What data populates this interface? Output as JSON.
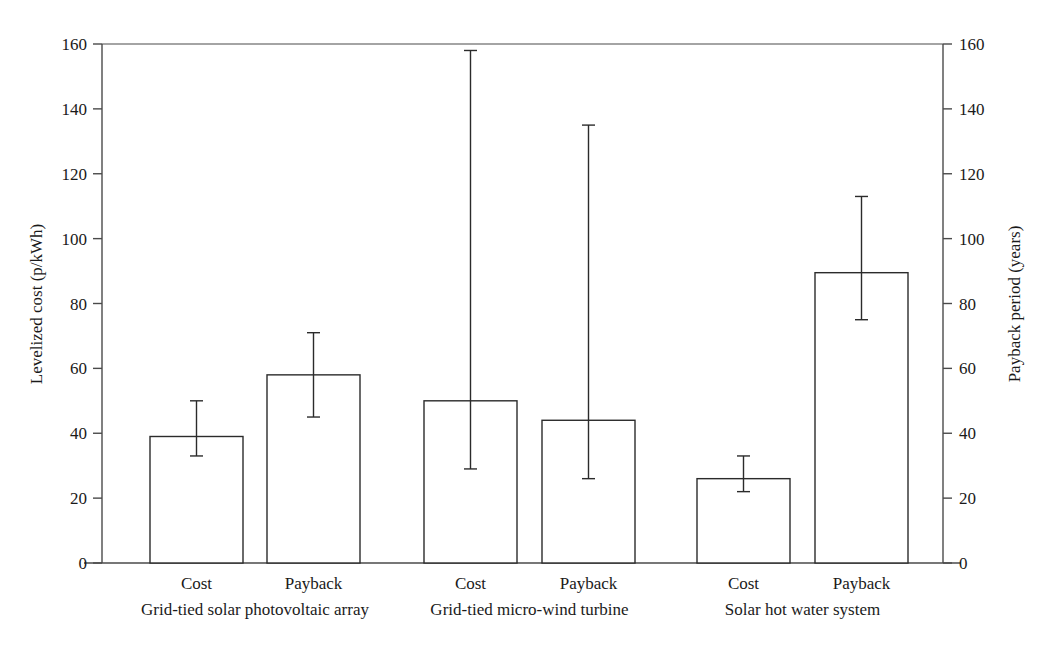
{
  "chart_data": {
    "type": "bar",
    "title": "",
    "subtitle": "",
    "grid": false,
    "legend": "none",
    "orientation": "vertical",
    "error_bars": true,
    "categories": [
      "Cost",
      "Payback",
      "Cost",
      "Payback",
      "Cost",
      "Payback"
    ],
    "groups": [
      {
        "label": "Grid-tied solar photovoltaic array",
        "bars": [
          {
            "category": "Cost",
            "axis": "left",
            "value": 39,
            "err_low": 33,
            "err_high": 50
          },
          {
            "category": "Payback",
            "axis": "right",
            "value": 58,
            "err_low": 45,
            "err_high": 71
          }
        ]
      },
      {
        "label": "Grid-tied micro-wind turbine",
        "bars": [
          {
            "category": "Cost",
            "axis": "left",
            "value": 50,
            "err_low": 29,
            "err_high": 158
          },
          {
            "category": "Payback",
            "axis": "right",
            "value": 44,
            "err_low": 26,
            "err_high": 135
          }
        ]
      },
      {
        "label": "Solar hot water system",
        "bars": [
          {
            "category": "Cost",
            "axis": "left",
            "value": 26,
            "err_low": 22,
            "err_high": 33
          },
          {
            "category": "Payback",
            "axis": "right",
            "value": 89.5,
            "err_low": 75,
            "err_high": 113
          }
        ]
      }
    ],
    "values": [
      39,
      58,
      50,
      44,
      26,
      89.5
    ],
    "err_low": [
      33,
      45,
      29,
      26,
      22,
      75
    ],
    "err_high": [
      50,
      71,
      158,
      135,
      33,
      113
    ],
    "axes": {
      "left": {
        "label": "Levelized cost (p/kWh)",
        "ylim": [
          0,
          160
        ],
        "ticks": [
          0,
          20,
          40,
          60,
          80,
          100,
          120,
          140,
          160
        ],
        "tick_labels": [
          "0",
          "20",
          "40",
          "60",
          "80",
          "100",
          "120",
          "140",
          "160"
        ]
      },
      "right": {
        "label": "Payback period (years)",
        "ylim": [
          0,
          160
        ],
        "ticks": [
          0,
          20,
          40,
          60,
          80,
          100,
          120,
          140,
          160
        ],
        "tick_labels": [
          "0",
          "20",
          "40",
          "60",
          "80",
          "100",
          "120",
          "140",
          "160"
        ]
      },
      "x": {
        "label": ""
      }
    },
    "xlabel": "",
    "ylabel": "Levelized cost (p/kWh)",
    "ylim": [
      0,
      160
    ],
    "colors": {
      "bar_fill": "#ffffff",
      "bar_stroke": "#2b2b2b",
      "axis": "#4a4a4a",
      "text": "#1a1a1a",
      "background": "#ffffff"
    }
  }
}
